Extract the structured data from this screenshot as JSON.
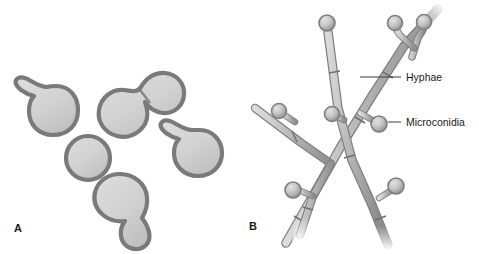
{
  "figure": {
    "panels": [
      {
        "letter": "A",
        "name": "yeast-cells-panel",
        "description": "Budding yeast cells",
        "letter_x": 14,
        "letter_y": 232
      },
      {
        "letter": "B",
        "name": "hyphae-panel",
        "description": "Branching hyphae with microconidia",
        "letter_x": 249,
        "letter_y": 230
      }
    ],
    "callouts": [
      {
        "label": "Hyphae",
        "name": "hyphae-label",
        "text_x": 406,
        "text_y": 81,
        "line_x1": 360,
        "line_y1": 77,
        "line_x2": 401,
        "line_y2": 77
      },
      {
        "label": "Microconidia",
        "name": "microconidia-label",
        "text_x": 406,
        "text_y": 126,
        "line_x1": 360,
        "line_y1": 122,
        "line_x2": 401,
        "line_y2": 122
      }
    ],
    "colors": {
      "background": "#ffffff",
      "cell_outline": "#7a7a7a",
      "cell_fill_light": "#d8d8d8",
      "cell_fill_mid": "#c2c2c2",
      "hypha_light": "#d2d2d2",
      "hypha_mid": "#a9a9a9",
      "hypha_dark": "#8c8c8c",
      "conidium_light": "#d6d6d6",
      "conidium_dark": "#969696",
      "leader_line": "#3d3d3d",
      "text": "#1a1a1a"
    },
    "yeast_cells": [
      {
        "name": "budding-cell-upper-left",
        "cx": 52,
        "cy": 110,
        "r": 24,
        "bud": "upper-left"
      },
      {
        "name": "budding-pair-large-cell",
        "cx": 126,
        "cy": 106,
        "r": 26,
        "bud": "upper-right-large"
      },
      {
        "name": "budding-pair-small-cell",
        "cx": 152,
        "cy": 77,
        "r": 19,
        "bud": "none"
      },
      {
        "name": "round-cell-center",
        "cx": 88,
        "cy": 158,
        "r": 23,
        "bud": "none"
      },
      {
        "name": "budding-cell-right",
        "cx": 196,
        "cy": 152,
        "r": 23,
        "bud": "upper-left"
      },
      {
        "name": "pear-cell-bottom",
        "cx": 123,
        "cy": 199,
        "r": 26,
        "bud": "lower-right-large"
      }
    ],
    "microconidia": [
      {
        "name": "microconidium-top-main",
        "cx": 327,
        "cy": 23,
        "r": 8
      },
      {
        "name": "microconidium-top-right-a",
        "cx": 395,
        "cy": 23,
        "r": 7.5
      },
      {
        "name": "microconidium-top-right-b",
        "cx": 424,
        "cy": 22,
        "r": 7.5
      },
      {
        "name": "microconidium-left-branch",
        "cx": 279,
        "cy": 111,
        "r": 7.5
      },
      {
        "name": "microconidium-center",
        "cx": 332,
        "cy": 114,
        "r": 7.5
      },
      {
        "name": "microconidium-labeled",
        "cx": 379,
        "cy": 124,
        "r": 8
      },
      {
        "name": "microconidium-lower-left",
        "cx": 293,
        "cy": 190,
        "r": 8
      },
      {
        "name": "microconidium-lower-right",
        "cx": 396,
        "cy": 186,
        "r": 8
      }
    ]
  }
}
